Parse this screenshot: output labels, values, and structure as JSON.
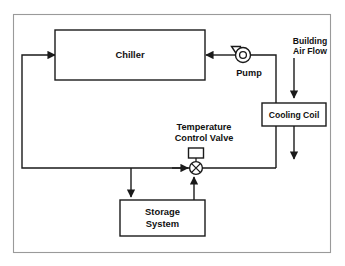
{
  "diagram": {
    "type": "process-flow-schematic",
    "canvas": {
      "width": 345,
      "height": 266
    },
    "colors": {
      "background": "#ffffff",
      "line": "#1a1a1a",
      "frame": "#9a9a9a",
      "text": "#111111"
    },
    "frame": {
      "x": 13,
      "y": 14,
      "width": 318,
      "height": 239
    },
    "nodes": [
      {
        "id": "chiller",
        "name": "chiller-box",
        "label": "Chiller",
        "shape": "rect",
        "x": 55,
        "y": 30,
        "width": 150,
        "height": 50,
        "label_lines": [
          "Chiller"
        ]
      },
      {
        "id": "cooling-coil",
        "name": "cooling-coil-box",
        "label": "Cooling Coil",
        "shape": "rect",
        "x": 262,
        "y": 103,
        "width": 64,
        "height": 23,
        "label_lines": [
          "Cooling Coil"
        ]
      },
      {
        "id": "storage-system",
        "name": "storage-system-box",
        "label": "Storage System",
        "shape": "rect",
        "x": 120,
        "y": 200,
        "width": 85,
        "height": 36,
        "label_lines": [
          "Storage",
          "System"
        ]
      },
      {
        "id": "pump",
        "name": "pump-symbol",
        "label": "Pump",
        "shape": "centrifugal-pump",
        "cx": 243,
        "cy": 55,
        "r": 7.5
      },
      {
        "id": "control-valve",
        "name": "control-valve-symbol",
        "label": "Temperature Control Valve",
        "shape": "three-way-control-valve",
        "cx": 196,
        "cy": 168,
        "r": 6.5,
        "actuator": {
          "x": 189,
          "y": 148,
          "width": 15,
          "height": 10
        }
      }
    ],
    "labels": [
      {
        "id": "pump-label",
        "name": "pump-label",
        "lines": [
          "Pump"
        ],
        "x": 249,
        "y": 75,
        "size": "normal"
      },
      {
        "id": "valve-label",
        "name": "temperature-control-valve-label",
        "lines": [
          "Temperature",
          "Control Valve"
        ],
        "x": 203,
        "y": 129,
        "size": "normal"
      },
      {
        "id": "airflow-label",
        "name": "building-air-flow-label",
        "lines": [
          "Building",
          "Air Flow"
        ],
        "x": 310,
        "y": 47,
        "size": "normal"
      }
    ],
    "flows": [
      {
        "id": "pump-to-chiller",
        "name": "pump-to-chiller-supply-line",
        "points": "235.5,55 205,55",
        "arrow": "end"
      },
      {
        "id": "coil-return-to-pump",
        "name": "cooling-coil-return-to-pump-line",
        "points": "276,168 276,55 250.5,55",
        "arrow": "none"
      },
      {
        "id": "chiller-return",
        "name": "chiller-return-line",
        "points": "202,168 22,168 22,55 55,55",
        "arrow": "end"
      },
      {
        "id": "valve-to-coil",
        "name": "valve-to-cooling-coil-line",
        "points": "202,168 276,168",
        "arrow": "none"
      },
      {
        "id": "branch-to-storage",
        "name": "branch-to-storage-line",
        "points": "131,168 131,198",
        "arrow": "end"
      },
      {
        "id": "storage-to-valve",
        "name": "storage-to-valve-line",
        "points": "194,200 194,178",
        "arrow": "end"
      },
      {
        "id": "supply-to-valve",
        "name": "supply-to-valve-line",
        "points": "170,168 189,168",
        "arrow": "end"
      },
      {
        "id": "air-in",
        "name": "building-air-inlet-arrow",
        "points": "294,58 294,99",
        "arrow": "end"
      },
      {
        "id": "air-out",
        "name": "building-air-outlet-arrow",
        "points": "294,126 294,160",
        "arrow": "end"
      }
    ]
  }
}
